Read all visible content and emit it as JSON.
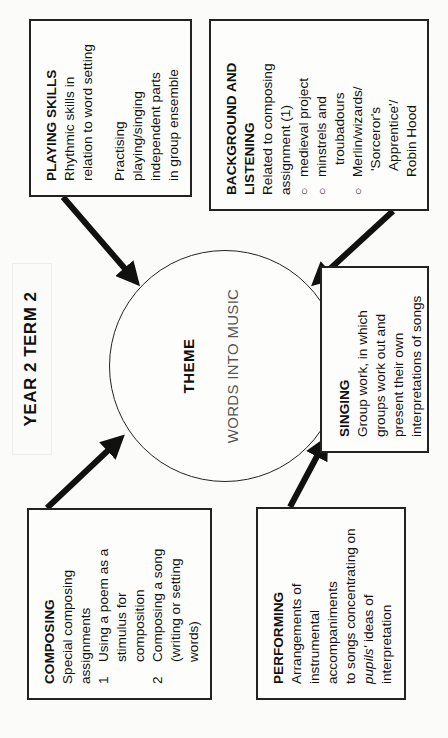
{
  "header": {
    "title": "YEAR 2 TERM 2"
  },
  "theme": {
    "title": "THEME",
    "subtitle": "WORDS INTO MUSIC"
  },
  "playing_skills": {
    "title": "PLAYING SKILLS",
    "lines_a": [
      "Rhythmic skills in",
      "relation to word setting"
    ],
    "lines_b": [
      "Practising",
      "playing/singing",
      "independent parts",
      "in group ensemble"
    ]
  },
  "background": {
    "title_line1": "BACKGROUND AND",
    "title_line2": "LISTENING",
    "intro": [
      "Related to composing",
      "assignment (1)"
    ],
    "bullet_symbol": "○",
    "items": [
      {
        "lines": [
          "medieval project"
        ]
      },
      {
        "lines": [
          "minstrels and",
          "troubadours"
        ]
      },
      {
        "lines": [
          "Merlin/wizards/",
          "'Sorceror's",
          "Apprentice'/",
          "Robin Hood"
        ]
      }
    ]
  },
  "composing": {
    "title": "COMPOSING",
    "intro": [
      "Special composing",
      "assignments"
    ],
    "items": [
      {
        "num": "1",
        "lines": [
          "Using a poem as a",
          "stimulus for",
          "composition"
        ]
      },
      {
        "num": "2",
        "lines": [
          "Composing a song",
          "(writing or setting",
          "words)"
        ]
      }
    ]
  },
  "performing": {
    "title": "PERFORMING",
    "lines": [
      "Arrangements of",
      "instrumental",
      "accompaniments",
      "to songs concentrating on"
    ],
    "italic_word": "pupils'",
    "after_italic": " ideas of",
    "last_line": "interpretation"
  },
  "singing": {
    "title": "SINGING",
    "lines": [
      "Group work, in which",
      "groups work out and",
      "present their own",
      "interpretations of songs"
    ]
  },
  "colors": {
    "ink": "#111111",
    "paper": "#fbfbf9",
    "subtitle_gray": "#555555"
  }
}
